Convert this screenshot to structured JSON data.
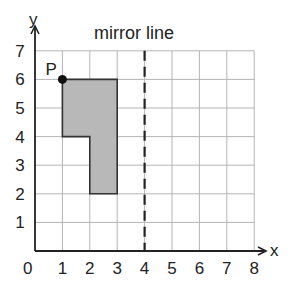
{
  "title": "mirror line",
  "axes": {
    "x_label": "x",
    "y_label": "y",
    "origin_label": "0",
    "x_ticks": [
      "1",
      "2",
      "3",
      "4",
      "5",
      "6",
      "7",
      "8"
    ],
    "y_ticks": [
      "1",
      "2",
      "3",
      "4",
      "5",
      "6",
      "7"
    ]
  },
  "grid": {
    "x_min": 0,
    "x_max": 8,
    "y_min": 0,
    "y_max": 7,
    "color": "#b5b5b5"
  },
  "shape": {
    "vertices": [
      [
        1,
        6
      ],
      [
        3,
        6
      ],
      [
        3,
        2
      ],
      [
        2,
        2
      ],
      [
        2,
        4
      ],
      [
        1,
        4
      ]
    ],
    "fill": "#b8b8b8",
    "stroke": "#333333"
  },
  "point": {
    "label": "P",
    "x": 1,
    "y": 6,
    "color": "#111111"
  },
  "mirror_line": {
    "x": 4,
    "style": "dashed",
    "color": "#222222"
  }
}
